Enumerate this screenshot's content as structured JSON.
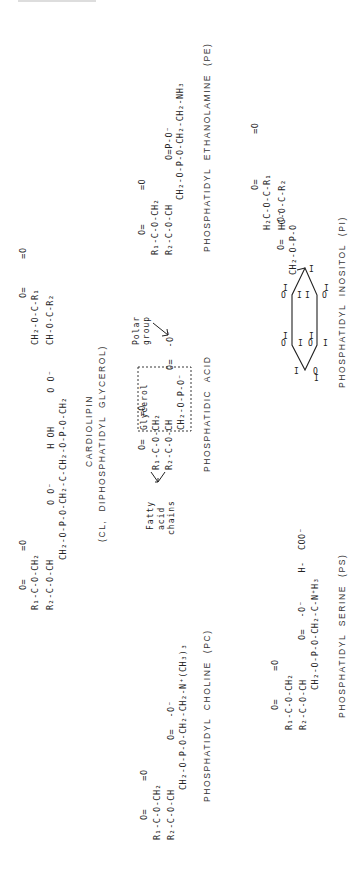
{
  "diagram": {
    "orientation": "rotated-90-ccw",
    "molecules": [
      {
        "id": "pe",
        "name": "PHOSPHATIDYL ETHANOLAMINE (PE)",
        "formula_lines": [
          "R₁-C-O-CH₂",
          "   ‖     |",
          "   O   O-CH",
          "R₂-C=O   |",
          "       CH₂-O-P-O-CH₂-CH₂-NH₃",
          "              ‖ |",
          "              O O⁻"
        ]
      },
      {
        "id": "pi",
        "name": "PHOSPHATIDYL INOSITOL (PI)",
        "formula_lines": [
          "H₂C-O-C-R₁",
          "       ‖",
          "HC-O-C-R₂",
          "  |   ‖",
          "  CH₂ O",
          "   |",
          "O=P-O⁻",
          "   |",
          "   O"
        ],
        "ring_labels": [
          "H",
          "OH",
          "H",
          "H",
          "OH",
          "HO",
          "H",
          "OH",
          "H",
          "OH",
          "H",
          "OH"
        ]
      },
      {
        "id": "cl",
        "name": "CARDIOLIPIN",
        "subtitle": "(CL, DIPHOSPHATIDYL GLYCEROL)",
        "formula_lines": [
          "R₁-C-O-CH₂             CH₂-O-C-R₁",
          "R₂-C-O-CH               CH-O-C-R₂",
          "      CH₂-O-P-O-CH₂-C-CH₂-O-P-O-CH₂",
          "           O O⁻    H OH      O O⁻"
        ]
      },
      {
        "id": "pa",
        "name": "PHOSPHATIDIC ACID",
        "formula_lines": [
          "R₁-C-O-CH₂",
          "R₂-C-O-CH",
          "       CH₂-O-P-O⁻",
          "            O O⁻"
        ],
        "annotations": {
          "polar_group": "Polar group",
          "glycerol": "Glycerol",
          "fatty_acid_chains": "Fatty acid chains"
        }
      },
      {
        "id": "ps",
        "name": "PHOSPHATIDYL SERINE (PS)",
        "formula_lines": [
          "R₁-C-O-CH₂",
          "R₂-C-O-CH",
          "       CH₂-O-P-O-CH₂-C-N⁺H₃",
          "            O O⁻     H COO⁻"
        ]
      },
      {
        "id": "pc",
        "name": "PHOSPHATIDYL CHOLINE (PC)",
        "formula_lines": [
          "R₁-C-O-CH₂",
          "R₂-C-O-CH",
          "       CH₂-O-P-O-CH₂-CH₂-N⁺(CH₃)₃",
          "            O O⁻"
        ]
      }
    ]
  },
  "text": {
    "pe_label": "PHOSPHATIDYL  ETHANOLAMINE  (PE)",
    "pe_chain": "CH₂-O-P-O-CH₂-CH₂-NH₃",
    "pe_r1": "R₁-C-O-CH₂",
    "pe_r2": "R₂-C-O-CH",
    "pe_carbonyl": "O=      =O",
    "pe_po": "O=P-O⁻",
    "pi_label": "PHOSPHATIDYL  INOSITOL  (PI)",
    "pi_r1": "H₂C-O-C-R₁",
    "pi_r2": "HC-O-C-R₂",
    "pi_carbonyl": "O=        =O",
    "pi_ch2": "CH₂-O-P-O",
    "pi_po": "O=  -O⁻",
    "cl_label": "CARDIOLIPIN",
    "cl_sublabel": "(CL,  DIPHOSPHATIDYL  GLYCEROL)",
    "cl_upper_r1": "CH₂-O-C-R₁",
    "cl_upper_r2": "CH-O-C-R₂",
    "cl_upper_co": "O=     =O",
    "cl_backbone": "CH₂-O-P-O-CH₂-C-CH₂-O-P-O-CH₂",
    "cl_backbone_sub": "O O⁻      H OH      O O⁻",
    "cl_lower_r1": "R₁-C-O-CH₂",
    "cl_lower_r2": "R₂-C-O-CH",
    "cl_lower_co": "O=     =O",
    "pa_label": "PHOSPHATIDIC  ACID",
    "pa_r1": "R₁-C-O-CH₂",
    "pa_r2": "R₂-C-O-CH",
    "pa_chain": "CH₂-O-P-O⁻",
    "pa_po": "O=  -O⁻",
    "pa_co": "O=    =O",
    "pa_polar": "Polar",
    "pa_group": "group",
    "pa_glycerol": "Glycerol",
    "pa_fatty": "Fatty",
    "pa_acid": "acid",
    "pa_chains": "chains",
    "ps_label": "PHOSPHATIDYL  SERINE  (PS)",
    "ps_r1": "R₁-C-O-CH₂",
    "ps_r2": "R₂-C-O-CH",
    "ps_co": "O=     =O",
    "ps_chain": "CH₂-O-P-O-CH₂-C-N⁺H₃",
    "ps_sub": "O=  -O⁻     H-  COO⁻",
    "pc_label": "PHOSPHATIDYL  CHOLINE  (PC)",
    "pc_r1": "R₁-C-O-CH₂",
    "pc_r2": "R₂-C-O-CH",
    "pc_co": "O=     =O",
    "pc_chain": "CH₂-O-P-O-CH₂-CH₂-N⁺(CH₃)₃",
    "pc_po": "O=  -O⁻"
  },
  "colors": {
    "ink": "#222222",
    "background": "#ffffff",
    "faint_header": "#dddddd"
  }
}
